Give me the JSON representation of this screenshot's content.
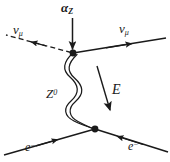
{
  "diagram": {
    "kind": "feynman-diagram",
    "stroke_color": "#1a1a1a",
    "background_color": "#ffffff",
    "labels": {
      "coupling": {
        "base": "α",
        "sub": "Z",
        "full": "α_Z"
      },
      "incoming_neutrino": {
        "base": "ν",
        "sub": "μ",
        "full": "ν_μ"
      },
      "outgoing_neutrino": {
        "base": "ν",
        "sub": "μ",
        "full": "ν_μ"
      },
      "boson": {
        "base": "Z",
        "sup": "0",
        "full": "Z⁰"
      },
      "energy": {
        "base": "E",
        "full": "E"
      },
      "incoming_electron": {
        "base": "e",
        "sup": "−",
        "full": "e−"
      },
      "outgoing_electron": {
        "base": "e",
        "sup": "−",
        "full": "e−"
      }
    },
    "vertices": [
      {
        "name": "upper-vertex",
        "x": 73,
        "y": 53
      },
      {
        "name": "lower-vertex",
        "x": 95,
        "y": 129
      }
    ],
    "lines": [
      {
        "name": "incoming-neutrino-line",
        "style": "dashed",
        "arrow": "toward-upper-left"
      },
      {
        "name": "outgoing-neutrino-line",
        "style": "solid",
        "arrow": "toward-upper-right"
      },
      {
        "name": "z-boson-propagator",
        "style": "wavy-double",
        "arrow": "none"
      },
      {
        "name": "incoming-electron-line",
        "style": "solid",
        "arrow": "toward-vertex"
      },
      {
        "name": "outgoing-electron-line",
        "style": "solid",
        "arrow": "toward-vertex"
      },
      {
        "name": "coupling-arrow",
        "style": "solid",
        "arrow": "downward"
      },
      {
        "name": "energy-arrow",
        "style": "solid",
        "arrow": "down-right"
      }
    ]
  }
}
